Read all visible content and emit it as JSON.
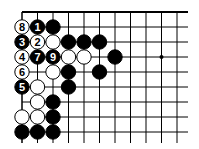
{
  "diagram": {
    "type": "go-board-fragment",
    "edges": [
      "top",
      "left"
    ],
    "grid": {
      "origin_x": 22,
      "origin_y": 12,
      "spacing_x": 15.5,
      "spacing_y": 15,
      "columns": 11,
      "rows": 9,
      "line_extend_right": 188,
      "line_extend_bottom": 143,
      "line_color": "#000000"
    },
    "star_points": [
      {
        "col": 9,
        "row": 3
      }
    ],
    "colors": {
      "black_stone": "#000000",
      "white_stone": "#ffffff",
      "stone_outline": "#000000",
      "black_label": "#ffffff",
      "white_label": "#000000"
    },
    "stones": [
      {
        "col": 0,
        "row": 1,
        "color": "white",
        "label": "8"
      },
      {
        "col": 1,
        "row": 1,
        "color": "black",
        "label": "1"
      },
      {
        "col": 2,
        "row": 1,
        "color": "black",
        "label": ""
      },
      {
        "col": 0,
        "row": 2,
        "color": "black",
        "label": "3"
      },
      {
        "col": 1,
        "row": 2,
        "color": "white",
        "label": "2"
      },
      {
        "col": 2,
        "row": 2,
        "color": "white",
        "label": ""
      },
      {
        "col": 3,
        "row": 2,
        "color": "black",
        "label": ""
      },
      {
        "col": 4,
        "row": 2,
        "color": "black",
        "label": ""
      },
      {
        "col": 5,
        "row": 2,
        "color": "black",
        "label": ""
      },
      {
        "col": 0,
        "row": 3,
        "color": "white",
        "label": "4"
      },
      {
        "col": 1,
        "row": 3,
        "color": "black",
        "label": "7"
      },
      {
        "col": 2,
        "row": 3,
        "color": "black",
        "label": "9"
      },
      {
        "col": 3,
        "row": 3,
        "color": "white",
        "label": ""
      },
      {
        "col": 4,
        "row": 3,
        "color": "white",
        "label": ""
      },
      {
        "col": 6,
        "row": 3,
        "color": "black",
        "label": ""
      },
      {
        "col": 0,
        "row": 4,
        "color": "white",
        "label": "6"
      },
      {
        "col": 2,
        "row": 4,
        "color": "white",
        "label": ""
      },
      {
        "col": 3,
        "row": 4,
        "color": "black",
        "label": ""
      },
      {
        "col": 5,
        "row": 4,
        "color": "black",
        "label": ""
      },
      {
        "col": 0,
        "row": 5,
        "color": "black",
        "label": "5"
      },
      {
        "col": 1,
        "row": 5,
        "color": "white",
        "label": ""
      },
      {
        "col": 3,
        "row": 5,
        "color": "black",
        "label": ""
      },
      {
        "col": 1,
        "row": 6,
        "color": "white",
        "label": ""
      },
      {
        "col": 2,
        "row": 6,
        "color": "black",
        "label": ""
      },
      {
        "col": 0,
        "row": 7,
        "color": "white",
        "label": ""
      },
      {
        "col": 1,
        "row": 7,
        "color": "white",
        "label": ""
      },
      {
        "col": 2,
        "row": 7,
        "color": "black",
        "label": ""
      },
      {
        "col": 0,
        "row": 8,
        "color": "black",
        "label": ""
      },
      {
        "col": 1,
        "row": 8,
        "color": "black",
        "label": ""
      },
      {
        "col": 2,
        "row": 8,
        "color": "black",
        "label": ""
      }
    ]
  }
}
